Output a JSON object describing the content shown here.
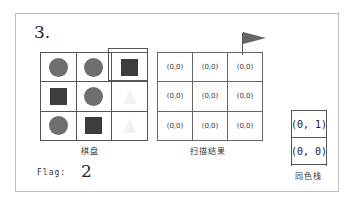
{
  "step_label": "3.",
  "board": {
    "caption": "棋盘",
    "cells": [
      [
        "circle",
        "circle",
        "square"
      ],
      [
        "square",
        "circle",
        "ghost"
      ],
      [
        "circle",
        "square",
        "ghost"
      ]
    ],
    "highlighted_cell": [
      0,
      2
    ]
  },
  "scan_result": {
    "caption": "扫描结果",
    "cells": [
      [
        "(0,0)",
        "(0,0)",
        "(0,0)"
      ],
      [
        "(0,0)",
        "(0,0)",
        "(0,0)"
      ],
      [
        "(0,0)",
        "(0,0)",
        "(0,0)"
      ]
    ],
    "flag_marker_cell": [
      0,
      2
    ]
  },
  "same_color_stack": {
    "caption": "同色栈",
    "items": [
      "(0, 1)",
      "(0, 0)"
    ]
  },
  "flag": {
    "label": "Flag:",
    "value": "2"
  },
  "colors": {
    "circle": "#6e6e6e",
    "square": "#3c3c3c",
    "ghost": "#f2f2f2",
    "flag": "#666666"
  }
}
